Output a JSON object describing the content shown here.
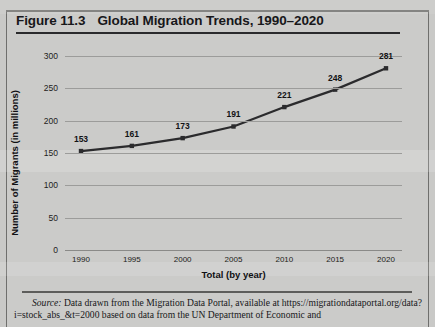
{
  "figure": {
    "number": "Figure 11.3",
    "title": "Global Migration Trends, 1990–2020"
  },
  "source": {
    "label": "Source:",
    "line1": " Data drawn from the Migration Data Portal, available at https://migrationdataportal",
    "line2": ".org/data?i=stock_abs_&t=2000 based on data from the UN Department of Economic and"
  },
  "colors": {
    "line": "#2b2b2d",
    "grid": "#9c9c9a",
    "text": "#17171a",
    "paper": "#cbcbc9"
  },
  "chart_data": {
    "type": "line",
    "title": "Global Migration Trends, 1990–2020",
    "xlabel": "Total (by year)",
    "ylabel": "Number of Migrants (in millions)",
    "categories": [
      "1990",
      "1995",
      "2000",
      "2005",
      "2010",
      "2015",
      "2020"
    ],
    "values": [
      153,
      161,
      173,
      191,
      221,
      248,
      281
    ],
    "point_labels": [
      "153",
      "161",
      "173",
      "191",
      "221",
      "248",
      "281"
    ],
    "ylim": [
      0,
      300
    ],
    "yticks": [
      0,
      50,
      100,
      150,
      200,
      250,
      300
    ],
    "ytick_labels": [
      "0",
      "50",
      "100",
      "150",
      "200",
      "250",
      "300"
    ],
    "grid": true,
    "legend": false,
    "markers": true
  }
}
